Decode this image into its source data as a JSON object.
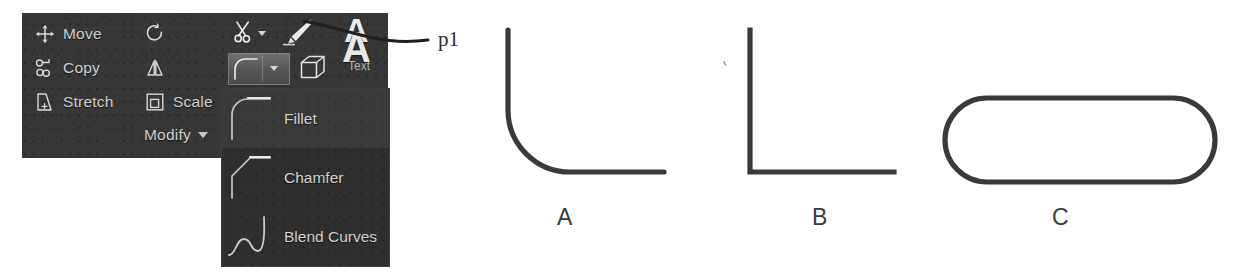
{
  "ribbon": {
    "panel_title": "Modify",
    "panel_caret_icon": "chevron-down-icon",
    "background_color": "#363636",
    "items": [
      {
        "label": "Move",
        "icon": "move-icon"
      },
      {
        "label": "Copy",
        "icon": "copy-icon"
      },
      {
        "label": "Stretch",
        "icon": "stretch-icon"
      },
      {
        "label": "",
        "icon": "rotate-icon"
      },
      {
        "label": "",
        "icon": "mirror-icon"
      },
      {
        "label": "Scale",
        "icon": "scale-icon"
      }
    ],
    "tools": [
      {
        "label": "",
        "icon": "trim-scissors-icon",
        "has_dropdown": true,
        "selected": false
      },
      {
        "label": "",
        "icon": "paint-brush-icon",
        "has_dropdown": false,
        "selected": false
      },
      {
        "label": "Text",
        "icon": "text-a-icon",
        "has_dropdown": false,
        "selected": false
      },
      {
        "label": "",
        "icon": "fillet-curve-icon",
        "has_dropdown": true,
        "selected": true
      },
      {
        "label": "",
        "icon": "3d-box-icon",
        "has_dropdown": false,
        "selected": false
      }
    ]
  },
  "flyout": {
    "items": [
      {
        "label": "Fillet",
        "icon": "fillet-preview-icon",
        "highlighted": true
      },
      {
        "label": "Chamfer",
        "icon": "chamfer-preview-icon",
        "highlighted": false
      },
      {
        "label": "Blend Curves",
        "icon": "blend-curves-preview-icon",
        "highlighted": false
      }
    ]
  },
  "annotation": {
    "leader_label": "p1",
    "leader_icon": "leader-line-icon"
  },
  "figures": [
    {
      "caption": "A",
      "shape": "filleted-corner",
      "description": "vertical and horizontal line joined by a rounded fillet arc"
    },
    {
      "caption": "B",
      "shape": "sharp-corner",
      "description": "vertical and horizontal line meeting at a square 90 degree corner"
    },
    {
      "caption": "C",
      "shape": "stadium-capsule",
      "description": "closed rounded rectangle with fully rounded left and right ends"
    }
  ],
  "colors": {
    "panel": "#363636",
    "flyout": "#2e2e2e",
    "panel_text": "#cfcfcf",
    "stroke": "#3a3a3a",
    "page": "#ffffff"
  }
}
